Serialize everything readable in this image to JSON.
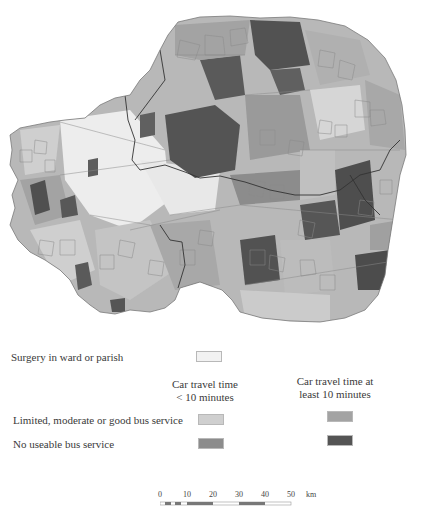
{
  "map": {
    "description": "Choropleth map of wards/parishes showing access to GP surgeries by car travel time and bus service",
    "outline_color": "#8a8a8a",
    "boundary_color": "#3a3a3a"
  },
  "legend": {
    "surgery_label": "Surgery in ward or parish",
    "col_head_1": "Car travel time\n< 10 minutes",
    "col_head_1_line1": "Car travel time",
    "col_head_1_line2": "< 10 minutes",
    "col_head_2_line1": "Car travel time at",
    "col_head_2_line2": "least 10 minutes",
    "row_bus_label": "Limited, moderate or good bus service",
    "row_nobus_label": "No useable bus service",
    "colors": {
      "surgery": "#f2f2f2",
      "lt10_bus": "#cfcfcf",
      "lt10_nobus": "#8c8c8c",
      "ge10_bus": "#a3a3a3",
      "ge10_nobus": "#545454"
    }
  },
  "scale": {
    "ticks": [
      "0",
      "10",
      "20",
      "30",
      "40",
      "50"
    ],
    "unit": "km"
  }
}
